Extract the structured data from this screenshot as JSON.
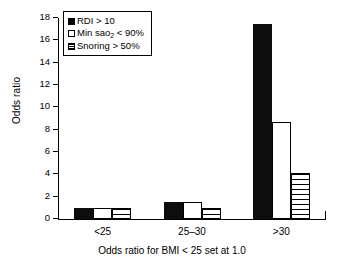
{
  "chart_data": {
    "type": "bar",
    "title": "",
    "subtitle": "",
    "xlabel": "Odds ratio for BMI < 25 set at 1.0",
    "ylabel": "Odds ratio",
    "categories": [
      "<25",
      "25–30",
      ">30"
    ],
    "ylim": [
      0,
      18
    ],
    "yticks": [
      0,
      2,
      4,
      6,
      8,
      10,
      12,
      14,
      16,
      18
    ],
    "ytick_labels": [
      "0",
      "2",
      "4",
      "6",
      "8",
      "10",
      "12",
      "14",
      "16",
      "18"
    ],
    "grid": false,
    "legend_position": "upper-left-inside",
    "series": [
      {
        "name": "RDI > 10",
        "fill": "solid-black",
        "color": "#000000",
        "values": [
          1.0,
          1.5,
          17.5
        ]
      },
      {
        "name": "Min sao2 < 90%",
        "name_parts": {
          "pre": "Min sao",
          "sub": "2",
          "post": " < 90%"
        },
        "fill": "open-white",
        "color": "#ffffff",
        "values": [
          1.0,
          1.5,
          8.7
        ]
      },
      {
        "name": "Snoring > 50%",
        "fill": "horizontal-hatch",
        "color": "#ffffff",
        "values": [
          1.0,
          1.0,
          4.1
        ]
      }
    ]
  },
  "axes": {
    "y_title": "Odds ratio",
    "x_title": "Odds ratio for BMI < 25 set at 1.0",
    "y_tick_labels": [
      "18",
      "16",
      "14",
      "12",
      "10",
      "8",
      "6",
      "4",
      "2",
      "0"
    ],
    "x_tick_labels": [
      "<25",
      "25–30",
      ">30"
    ]
  },
  "legend": {
    "items": [
      {
        "label": "RDI > 10",
        "swatch": "solid-black-square-icon"
      },
      {
        "label_pre": "Min sao",
        "label_sub": "2",
        "label_post": " < 90%",
        "swatch": "open-square-icon"
      },
      {
        "label": "Snoring > 50%",
        "swatch": "hatched-square-icon"
      }
    ]
  }
}
